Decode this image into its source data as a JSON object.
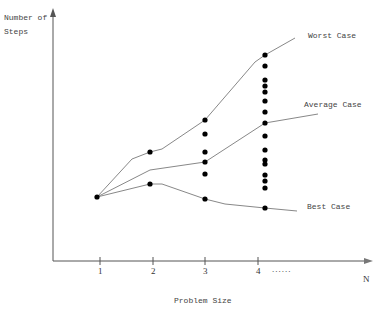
{
  "diagram": {
    "y_axis_label_line1": "Number of",
    "y_axis_label_line2": "Steps",
    "x_axis_label": "Problem Size",
    "x_axis_end_label": "N",
    "x_ticks": [
      "1",
      "2",
      "3",
      "4"
    ],
    "ellipsis": "......",
    "curves": [
      {
        "name": "Worst  Case"
      },
      {
        "name": "Average Case"
      },
      {
        "name": "Best Case"
      }
    ],
    "colors": {
      "line": "#888888",
      "dot": "#000000",
      "axis": "#555555"
    }
  }
}
